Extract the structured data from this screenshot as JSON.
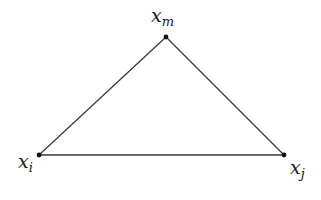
{
  "diagram": {
    "type": "triangle",
    "stroke_color": "#3a3a3a",
    "vertex_color": "#111111",
    "vertices": [
      {
        "id": "i",
        "base": "x",
        "sub": "i",
        "x": 39,
        "y": 155
      },
      {
        "id": "j",
        "base": "x",
        "sub": "j",
        "x": 284,
        "y": 155
      },
      {
        "id": "m",
        "base": "x",
        "sub": "m",
        "x": 166,
        "y": 37
      }
    ],
    "edges": [
      [
        "i",
        "j"
      ],
      [
        "j",
        "m"
      ],
      [
        "m",
        "i"
      ]
    ]
  }
}
